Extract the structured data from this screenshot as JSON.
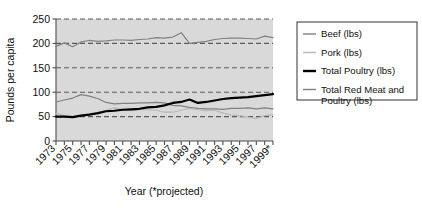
{
  "chart_data": {
    "type": "line",
    "title": "",
    "xlabel": "Year (*projected)",
    "ylabel": "Pounds per capita",
    "ylim": [
      0,
      250
    ],
    "yticks": [
      0,
      50,
      100,
      150,
      200,
      250
    ],
    "ytick_labels": [
      "0",
      "50",
      "100",
      "150",
      "200",
      "250"
    ],
    "grid": true,
    "grid_style": "dashed-horizontal",
    "legend_position": "right-outside",
    "x": [
      1973,
      1974,
      1975,
      1976,
      1977,
      1978,
      1979,
      1980,
      1981,
      1982,
      1983,
      1984,
      1985,
      1986,
      1987,
      1988,
      1989,
      1990,
      1991,
      1992,
      1993,
      1994,
      1995,
      1996,
      1997,
      1998,
      1999
    ],
    "xtick_labels": [
      "1973",
      "1974",
      "1975",
      "1976",
      "1977",
      "1978",
      "1979",
      "1980",
      "1981",
      "1982",
      "1983",
      "1984",
      "1985",
      "1986",
      "1987",
      "1988",
      "1989",
      "1990",
      "1991",
      "1992",
      "1993",
      "1994",
      "1995",
      "1996",
      "1997",
      "1998",
      "1999*"
    ],
    "xtick_labels_shown": [
      "1973",
      "1975",
      "1977",
      "1979",
      "1981",
      "1983",
      "1985",
      "1987",
      "1989",
      "1991",
      "1993",
      "1995",
      "1997",
      "1999*"
    ],
    "xtick_label_rotation": -45,
    "series": [
      {
        "name": "Beef (lbs)",
        "color": "#808080",
        "width": 1.2,
        "values": [
          80,
          84,
          88,
          95,
          92,
          87,
          79,
          76,
          77,
          77,
          78,
          78,
          79,
          78,
          73,
          72,
          69,
          67,
          66,
          66,
          65,
          67,
          67,
          68,
          66,
          68,
          66
        ]
      },
      {
        "name": "Pork (lbs)",
        "color": "#b8b8b8",
        "width": 1.2,
        "values": [
          57,
          52,
          50,
          53,
          55,
          55,
          63,
          68,
          65,
          62,
          65,
          64,
          63,
          59,
          59,
          63,
          67,
          64,
          62,
          63,
          57,
          53,
          52,
          49,
          46,
          52,
          54
        ]
      },
      {
        "name": "Total Poultry (lbs)",
        "color": "#000000",
        "width": 2.2,
        "values": [
          50,
          50,
          49,
          52,
          54,
          57,
          61,
          62,
          64,
          65,
          66,
          69,
          70,
          73,
          78,
          80,
          85,
          78,
          80,
          83,
          86,
          88,
          89,
          90,
          92,
          94,
          96
        ]
      },
      {
        "name": "Total Red Meat and Poultry (lbs)",
        "color": "#808080",
        "width": 1.2,
        "values": [
          194,
          201,
          193,
          203,
          206,
          204,
          205,
          207,
          207,
          206,
          208,
          209,
          212,
          211,
          213,
          222,
          200,
          202,
          204,
          208,
          210,
          211,
          211,
          210,
          209,
          215,
          212
        ]
      }
    ]
  },
  "legend": {
    "items": [
      {
        "label": "Beef (lbs)",
        "color": "#808080",
        "width": 1.4
      },
      {
        "label": "Pork (lbs)",
        "color": "#b8b8b8",
        "width": 1.4
      },
      {
        "label": "Total Poultry (lbs)",
        "color": "#000000",
        "width": 2.4
      },
      {
        "label": "Total Red Meat and",
        "label2": "Poultry (lbs)",
        "color": "#808080",
        "width": 1.4
      }
    ]
  },
  "style": {
    "plot_background": "#d9d9d9",
    "grid_color": "#595959",
    "axis_color": "#4d4d4d",
    "legend_border": "#333333",
    "page_background": "#ffffff"
  }
}
